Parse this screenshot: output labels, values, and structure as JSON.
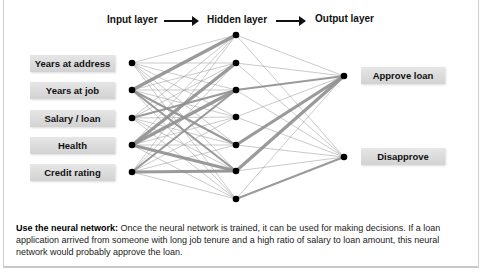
{
  "header": {
    "input_layer": "Input layer",
    "hidden_layer": "Hidden layer",
    "output_layer": "Output layer"
  },
  "inputs": [
    {
      "label": "Years at address"
    },
    {
      "label": "Years at job"
    },
    {
      "label": "Salary / loan"
    },
    {
      "label": "Health"
    },
    {
      "label": "Credit rating"
    }
  ],
  "outputs": [
    {
      "label": "Approve loan"
    },
    {
      "label": "Disapprove"
    }
  ],
  "caption": {
    "title": "Use the neural network:",
    "body": " Once the neural network is trained, it can be used for making decisions. If a loan application arrived from someone with long job tenure and a high ratio of salary to loan amount, this neural network would probably approve the loan."
  },
  "network": {
    "input_nodes": [
      [
        132,
        63
      ],
      [
        132,
        90
      ],
      [
        132,
        118
      ],
      [
        132,
        145
      ],
      [
        132,
        172
      ]
    ],
    "hidden_nodes": [
      [
        236,
        35
      ],
      [
        236,
        63
      ],
      [
        236,
        90
      ],
      [
        236,
        117
      ],
      [
        236,
        145
      ],
      [
        236,
        171
      ],
      [
        236,
        199
      ]
    ],
    "output_nodes": [
      [
        344,
        76
      ],
      [
        344,
        157
      ]
    ],
    "edge_color": "#8f8f8f",
    "node_color": "#000000"
  }
}
